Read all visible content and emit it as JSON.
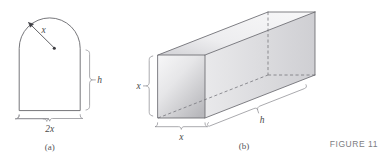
{
  "figure": {
    "figure_number": "FIGURE 11",
    "panels": [
      {
        "caption": "(a)",
        "shape": "arch-rectangle-with-semicircular-top",
        "labels": {
          "radius": "x",
          "height": "h",
          "width": "2x"
        }
      },
      {
        "caption": "(b)",
        "shape": "rectangular-prism-box",
        "labels": {
          "depth": "x",
          "width": "x",
          "length": "h"
        }
      }
    ],
    "colors": {
      "background": "#ffffff",
      "outline": "#5d5d62",
      "bracket": "#8e8e93",
      "label_text": "#4a4a4a",
      "caption_text": "#55555a",
      "figure_number_text": "#7d7d82",
      "box_fill_light": "#fafafa",
      "box_fill_dark": "#b9b9bd"
    }
  }
}
